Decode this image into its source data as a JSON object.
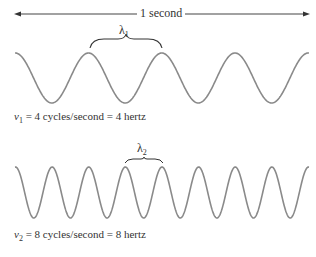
{
  "title_span": "1 second",
  "waves": [
    {
      "wavelength_symbol": "λ",
      "wavelength_subscript": "1",
      "freq_symbol": "ν",
      "freq_subscript": "1",
      "caption_rest": " = 4 cycles/second = 4 hertz",
      "cycles_per_second": 4
    },
    {
      "wavelength_symbol": "λ",
      "wavelength_subscript": "2",
      "freq_symbol": "ν",
      "freq_subscript": "2",
      "caption_rest": " = 8 cycles/second = 8 hertz",
      "cycles_per_second": 8
    }
  ],
  "colors": {
    "wave": "#8a8a8a",
    "arrow": "#444444",
    "brace": "#333333",
    "text": "#333333"
  }
}
